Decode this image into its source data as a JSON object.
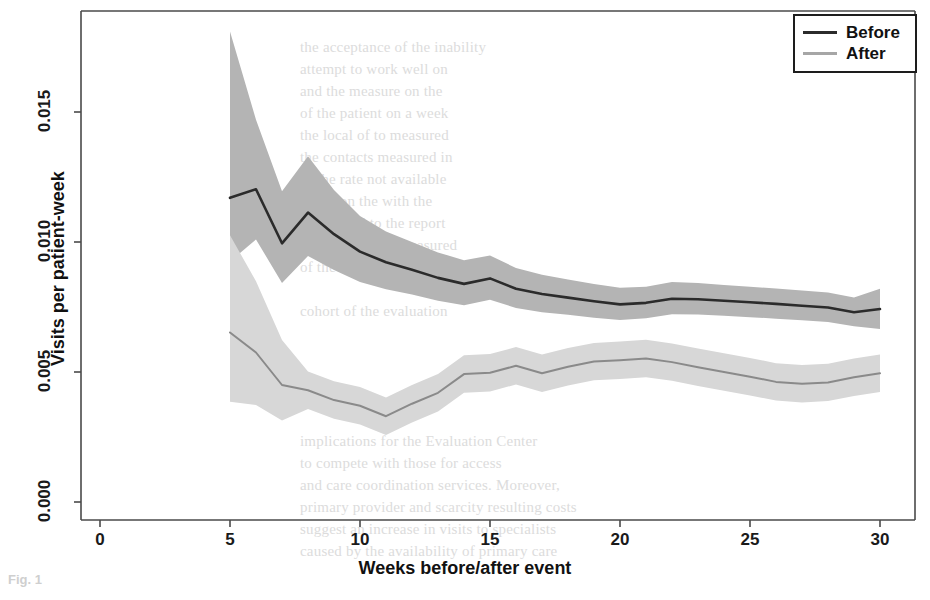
{
  "chart_data": {
    "type": "line",
    "title": "",
    "xlabel": "Weeks before/after event",
    "ylabel": "Visits per patient-week",
    "xlim": [
      -1.5,
      31.5
    ],
    "ylim": [
      -0.0009,
      0.0185
    ],
    "xticks": [
      0,
      5,
      10,
      15,
      20,
      25,
      30
    ],
    "xticklabels": [
      "0",
      "5",
      "10",
      "15",
      "20",
      "25",
      "30"
    ],
    "yticks": [
      0.0,
      0.005,
      0.01,
      0.015
    ],
    "yticklabels": [
      "0.000",
      "0.005",
      "0.010",
      "0.015"
    ],
    "grid": false,
    "legend_position": "top-right",
    "x": [
      5,
      6,
      7,
      8,
      9,
      10,
      11,
      12,
      13,
      14,
      15,
      16,
      17,
      18,
      19,
      20,
      21,
      22,
      23,
      24,
      25,
      26,
      27,
      28,
      29,
      30
    ],
    "series": [
      {
        "name": "Before",
        "color": "#2b2b2b",
        "band_color": "#b4b4b4",
        "values": [
          0.0117,
          0.01203,
          0.00995,
          0.01113,
          0.0103,
          0.00963,
          0.00922,
          0.00893,
          0.00862,
          0.00839,
          0.0086,
          0.0082,
          0.008,
          0.00786,
          0.00772,
          0.0076,
          0.00766,
          0.00782,
          0.0078,
          0.00774,
          0.00768,
          0.00762,
          0.00755,
          0.00748,
          0.0073,
          0.00742
        ],
        "band_lower": [
          0.00925,
          0.0101,
          0.00842,
          0.00946,
          0.00892,
          0.00846,
          0.00818,
          0.00798,
          0.00774,
          0.00757,
          0.00778,
          0.00746,
          0.0073,
          0.0072,
          0.00709,
          0.007,
          0.00707,
          0.00722,
          0.00721,
          0.00716,
          0.00711,
          0.00705,
          0.00699,
          0.00692,
          0.00676,
          0.00665
        ],
        "band_upper": [
          0.0181,
          0.0147,
          0.01195,
          0.0133,
          0.012,
          0.011,
          0.0104,
          0.01,
          0.0096,
          0.0093,
          0.00948,
          0.009,
          0.00874,
          0.00856,
          0.00838,
          0.00824,
          0.00828,
          0.00846,
          0.00842,
          0.00835,
          0.00828,
          0.00821,
          0.00813,
          0.00806,
          0.00787,
          0.0082
        ]
      },
      {
        "name": "After",
        "color": "#8a8a8a",
        "band_color": "#d7d7d7",
        "values": [
          0.00652,
          0.00575,
          0.0045,
          0.0043,
          0.00392,
          0.0037,
          0.0033,
          0.00378,
          0.0042,
          0.00492,
          0.00497,
          0.00524,
          0.00495,
          0.0052,
          0.0054,
          0.00545,
          0.00552,
          0.00538,
          0.00518,
          0.005,
          0.00482,
          0.00462,
          0.00455,
          0.0046,
          0.0048,
          0.00495
        ]
      }
    ]
  },
  "legend": {
    "items": [
      {
        "label": "Before",
        "color": "#2b2b2b",
        "width": 3
      },
      {
        "label": "After",
        "color": "#9d9d9d",
        "width": 3
      }
    ]
  },
  "caption": {
    "text": "Fig. 1"
  },
  "ghost_text": {
    "lines": [
      {
        "text": "the acceptance of the inability",
        "x": 300,
        "y": 36
      },
      {
        "text": "attempt to  work  well  on",
        "x": 300,
        "y": 58
      },
      {
        "text": "and  the  measure  on  the",
        "x": 300,
        "y": 80
      },
      {
        "text": "of  the  patient  on  a  week",
        "x": 300,
        "y": 102
      },
      {
        "text": "the  local  of  to  measured",
        "x": 300,
        "y": 124
      },
      {
        "text": "the  contacts  measured  in",
        "x": 300,
        "y": 146
      },
      {
        "text": "of  the  rate  not  available",
        "x": 300,
        "y": 168
      },
      {
        "text": "the  or  on  the  with  the",
        "x": 300,
        "y": 190
      },
      {
        "text": "period  and  to  the  report",
        "x": 300,
        "y": 212
      },
      {
        "text": "for  which  to  be  measured",
        "x": 300,
        "y": 234
      },
      {
        "text": "of  the  visits  the  patient",
        "x": 300,
        "y": 256
      },
      {
        "text": "cohort  of  the  evaluation",
        "x": 300,
        "y": 300
      },
      {
        "text": "implications for the Evaluation Center",
        "x": 300,
        "y": 430
      },
      {
        "text": "to  compete  with  those  for  access",
        "x": 300,
        "y": 452
      },
      {
        "text": "and  care  coordination  services.  Moreover,",
        "x": 300,
        "y": 474
      },
      {
        "text": "primary  provider  and  scarcity  resulting  costs",
        "x": 300,
        "y": 496
      },
      {
        "text": "suggest an increase in visits to specialists",
        "x": 300,
        "y": 518
      },
      {
        "text": "caused by the availability of primary care",
        "x": 300,
        "y": 540
      }
    ]
  }
}
